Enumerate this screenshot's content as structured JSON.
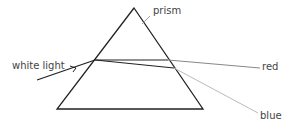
{
  "diagram": {
    "labels": {
      "prism": "prism",
      "white_light": "white light",
      "red": "red",
      "blue": "blue"
    },
    "colors": {
      "prism_outline": "#222222",
      "incident_ray": "#222222",
      "red_ray_outside": "#888888",
      "blue_ray_outside": "#bbbbbb",
      "text": "#444444"
    }
  }
}
